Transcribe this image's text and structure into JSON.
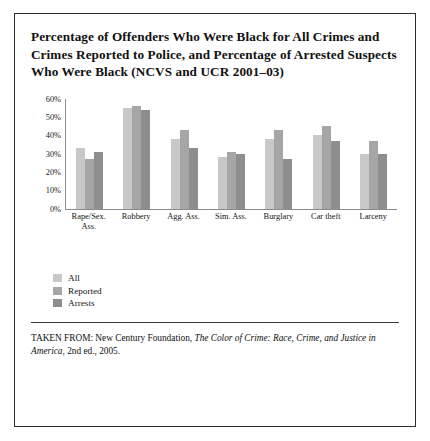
{
  "figure": {
    "title": "Percentage of Offenders Who Were Black for All Crimes and Crimes Reported to Police, and Percentage of Arrested Suspects Who Were Black (NCVS and UCR 2001–03)",
    "source_prefix": "TAKEN FROM: New Century Foundation, ",
    "source_italic": "The Color of Crime: Race, Crime, and Justice in America",
    "source_suffix": ", 2nd ed., 2005."
  },
  "colors": {
    "series_all": "#c8c8c8",
    "series_reported": "#a6a6a6",
    "series_arrests": "#8e8e8e",
    "frame_border": "#2b2b2b",
    "axis_line": "#8a8a8a",
    "text": "#111111"
  },
  "chart_data": {
    "type": "bar",
    "title": "Percentage of Offenders Who Were Black for All Crimes and Crimes Reported to Police, and Percentage of Arrested Suspects Who Were Black (NCVS and UCR 2001–03)",
    "xlabel": "",
    "ylabel": "",
    "ylim": [
      0,
      60
    ],
    "grid": false,
    "legend_position": "below-left",
    "ytick_labels": [
      "60%",
      "50%",
      "40%",
      "30%",
      "20%",
      "10%",
      "0%"
    ],
    "ytick_values": [
      60,
      50,
      40,
      30,
      20,
      10,
      0
    ],
    "categories": [
      "Rape/Sex. Ass.",
      "Robbery",
      "Agg. Ass.",
      "Sim. Ass.",
      "Burglary",
      "Car theft",
      "Larceny"
    ],
    "series": [
      {
        "name": "All",
        "values": [
          33,
          55,
          38,
          28,
          38,
          40,
          30
        ]
      },
      {
        "name": "Reported",
        "values": [
          27,
          56,
          43,
          31,
          43,
          45,
          37
        ]
      },
      {
        "name": "Arrests",
        "values": [
          31,
          54,
          33,
          30,
          27,
          37,
          30
        ]
      }
    ]
  }
}
